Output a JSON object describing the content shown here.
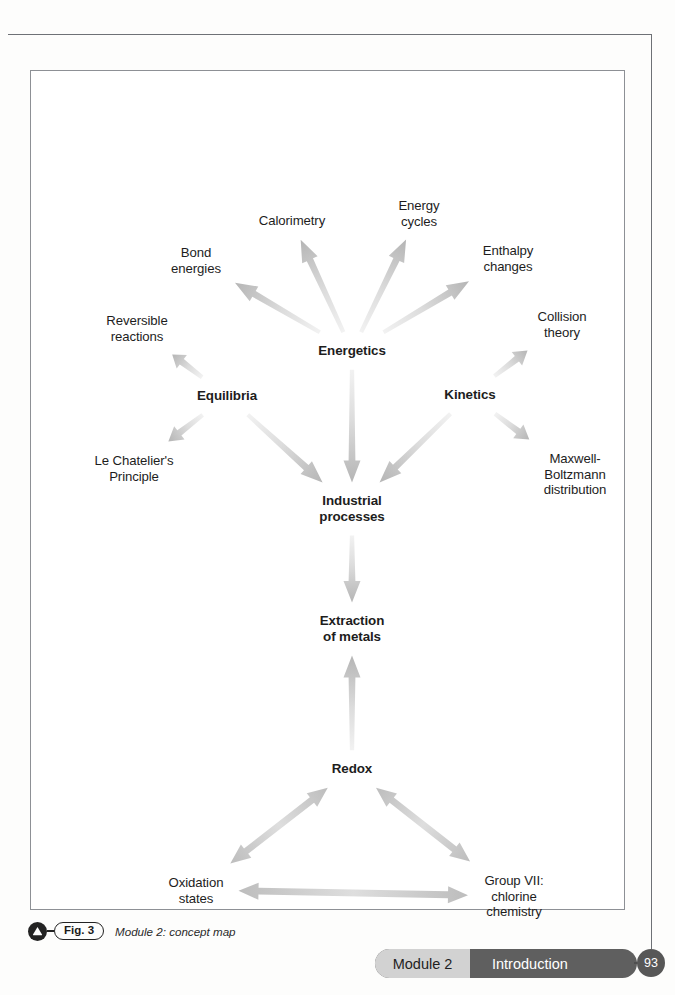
{
  "page": {
    "number": "93"
  },
  "figure": {
    "label": "Fig. 3",
    "caption": "Module 2: concept map",
    "icon": "triangle-badge-icon"
  },
  "footer": {
    "module_label": "Module 2",
    "section_label": "Introduction"
  },
  "concept_map": {
    "nodes": [
      {
        "id": "calorimetry",
        "label": "Calorimetry",
        "main": false,
        "x": 262,
        "y": 151
      },
      {
        "id": "energy-cycles",
        "label": "Energy\ncycles",
        "main": false,
        "x": 389,
        "y": 143
      },
      {
        "id": "bond-energies",
        "label": "Bond\nenergies",
        "main": false,
        "x": 166,
        "y": 190
      },
      {
        "id": "enthalpy",
        "label": "Enthalpy\nchanges",
        "main": false,
        "x": 478,
        "y": 188
      },
      {
        "id": "reversible",
        "label": "Reversible\nreactions",
        "main": false,
        "x": 107,
        "y": 258
      },
      {
        "id": "collision",
        "label": "Collision\ntheory",
        "main": false,
        "x": 532,
        "y": 254
      },
      {
        "id": "energetics",
        "label": "Energetics",
        "main": true,
        "x": 322,
        "y": 281
      },
      {
        "id": "equilibria",
        "label": "Equilibria",
        "main": true,
        "x": 197,
        "y": 326
      },
      {
        "id": "kinetics",
        "label": "Kinetics",
        "main": true,
        "x": 440,
        "y": 325
      },
      {
        "id": "le-chatelier",
        "label": "Le Chatelier's\nPrinciple",
        "main": false,
        "x": 104,
        "y": 398
      },
      {
        "id": "maxwell",
        "label": "Maxwell-\nBoltzmann\ndistribution",
        "main": false,
        "x": 545,
        "y": 404
      },
      {
        "id": "industrial",
        "label": "Industrial\nprocesses",
        "main": true,
        "x": 322,
        "y": 439
      },
      {
        "id": "extraction",
        "label": "Extraction\nof metals",
        "main": true,
        "x": 322,
        "y": 559
      },
      {
        "id": "redox",
        "label": "Redox",
        "main": true,
        "x": 322,
        "y": 699
      },
      {
        "id": "oxidation",
        "label": "Oxidation\nstates",
        "main": false,
        "x": 166,
        "y": 820
      },
      {
        "id": "group-vii",
        "label": "Group VII:\nchlorine\nchemistry",
        "main": false,
        "x": 484,
        "y": 826
      }
    ],
    "edges": [
      {
        "from": "energetics",
        "to": "calorimetry",
        "double": false
      },
      {
        "from": "energetics",
        "to": "energy-cycles",
        "double": false
      },
      {
        "from": "energetics",
        "to": "bond-energies",
        "double": false
      },
      {
        "from": "energetics",
        "to": "enthalpy",
        "double": false
      },
      {
        "from": "energetics",
        "to": "industrial",
        "double": false
      },
      {
        "from": "equilibria",
        "to": "reversible",
        "double": false
      },
      {
        "from": "equilibria",
        "to": "le-chatelier",
        "double": false
      },
      {
        "from": "equilibria",
        "to": "industrial",
        "double": false
      },
      {
        "from": "kinetics",
        "to": "collision",
        "double": false
      },
      {
        "from": "kinetics",
        "to": "maxwell",
        "double": false
      },
      {
        "from": "kinetics",
        "to": "industrial",
        "double": false
      },
      {
        "from": "industrial",
        "to": "extraction",
        "double": false
      },
      {
        "from": "redox",
        "to": "extraction",
        "double": false
      },
      {
        "from": "redox",
        "to": "oxidation",
        "double": true
      },
      {
        "from": "redox",
        "to": "group-vii",
        "double": true
      },
      {
        "from": "oxidation",
        "to": "group-vii",
        "double": true
      }
    ],
    "arrow_color_light": "#e6e6e6",
    "arrow_color_dark": "#b9b9b9"
  }
}
